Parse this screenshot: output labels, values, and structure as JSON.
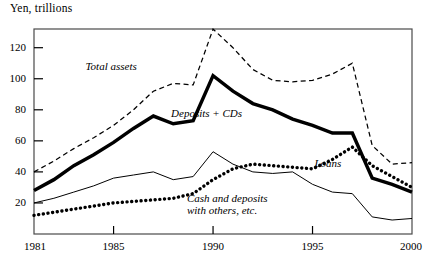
{
  "axis_title": "Yen, trillions",
  "plot": {
    "x0": 34,
    "x1": 412,
    "y_top": 29,
    "y_bottom": 234,
    "year_min": 1981,
    "year_max": 2000,
    "value_at_ybottom": 0,
    "px_per_unit": 1.5525
  },
  "y_ticks": [
    {
      "label": "20",
      "value": 20
    },
    {
      "label": "40",
      "value": 40
    },
    {
      "label": "60",
      "value": 60
    },
    {
      "label": "80",
      "value": 80
    },
    {
      "label": "100",
      "value": 100
    },
    {
      "label": "120",
      "value": 120
    }
  ],
  "x_ticks": [
    {
      "label": "1981",
      "value": 1981
    },
    {
      "label": "1985",
      "value": 1985
    },
    {
      "label": "1990",
      "value": 1990
    },
    {
      "label": "1995",
      "value": 1995
    },
    {
      "label": "2000",
      "value": 2000
    }
  ],
  "series_labels": {
    "total_assets": "Total assets",
    "deposits_cds": "Deposits + CDs",
    "loans": "Loans",
    "cash_deposits_line1": "Cash and deposits",
    "cash_deposits_line2": "with others, etc."
  },
  "colors": {
    "ink": "#000000",
    "axis": "#4a4a4a",
    "background": "#ffffff"
  },
  "chart_data": {
    "type": "line",
    "title": "",
    "subtitle": "",
    "xlabel": "",
    "ylabel": "Yen, trillions",
    "xlim": [
      1981,
      2000
    ],
    "ylim": [
      0,
      140
    ],
    "grid": false,
    "legend": "inline-annotations",
    "x": [
      1981,
      1982,
      1983,
      1984,
      1985,
      1986,
      1987,
      1988,
      1989,
      1990,
      1991,
      1992,
      1993,
      1994,
      1995,
      1996,
      1997,
      1998,
      1999,
      2000
    ],
    "series": [
      {
        "name": "Total assets",
        "style": "dashed",
        "values": [
          40,
          47,
          55,
          62,
          70,
          80,
          92,
          97,
          96,
          132,
          120,
          106,
          99,
          98,
          99,
          103,
          110,
          57,
          45,
          46
        ]
      },
      {
        "name": "Deposits + CDs",
        "style": "thick-solid",
        "values": [
          28,
          35,
          44,
          51,
          59,
          68,
          76,
          71,
          73,
          102,
          92,
          84,
          80,
          74,
          70,
          65,
          65,
          36,
          32,
          27
        ]
      },
      {
        "name": "Loans",
        "style": "dotted",
        "values": [
          12,
          14,
          16,
          18,
          20,
          21,
          22,
          23,
          26,
          35,
          42,
          45,
          44,
          43,
          42,
          48,
          56,
          44,
          37,
          30
        ]
      },
      {
        "name": "Cash and deposits with others, etc.",
        "style": "thin-solid",
        "values": [
          20,
          23,
          27,
          31,
          36,
          38,
          40,
          35,
          37,
          53,
          45,
          40,
          39,
          40,
          32,
          27,
          26,
          11,
          9,
          10
        ]
      }
    ],
    "annotations": [
      {
        "text": "Total assets",
        "x": 1985.5,
        "y": 108
      },
      {
        "text": "Deposits + CDs",
        "x": 1989.5,
        "y": 78
      },
      {
        "text": "Loans",
        "x": 1995.5,
        "y": 46
      },
      {
        "text": "Cash and deposits with others, etc.",
        "x": 1991.0,
        "y": 22
      }
    ]
  }
}
